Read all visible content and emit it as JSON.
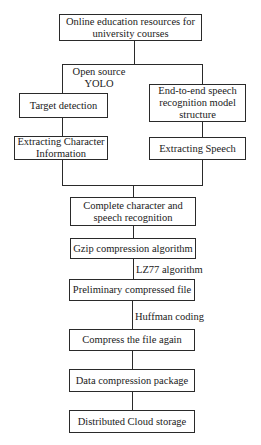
{
  "diagram": {
    "type": "flowchart",
    "nodes": {
      "source": "Online education resources for university courses",
      "target_detection": "Target detection",
      "speech_model": "End-to-end speech recognition model structure",
      "extract_char": "Extracting Character Information",
      "extract_speech": "Extracting Speech",
      "complete": "Complete character and speech recognition",
      "gzip": "Gzip compression algorithm",
      "preliminary": "Preliminary compressed file",
      "compress_again": "Compress the file again",
      "package": "Data compression package",
      "cloud": "Distributed Cloud storage"
    },
    "edge_labels": {
      "yolo": "Open source YOLO",
      "lz77": "LZ77 algorithm",
      "huffman": "Huffman coding"
    },
    "edges": [
      {
        "from": "source",
        "to": "target_detection",
        "label": "Open source YOLO"
      },
      {
        "from": "source",
        "to": "speech_model"
      },
      {
        "from": "target_detection",
        "to": "extract_char"
      },
      {
        "from": "speech_model",
        "to": "extract_speech"
      },
      {
        "from": "extract_char",
        "to": "complete"
      },
      {
        "from": "extract_speech",
        "to": "complete"
      },
      {
        "from": "complete",
        "to": "gzip"
      },
      {
        "from": "gzip",
        "to": "preliminary",
        "label": "LZ77 algorithm"
      },
      {
        "from": "preliminary",
        "to": "compress_again",
        "label": "Huffman coding"
      },
      {
        "from": "compress_again",
        "to": "package"
      },
      {
        "from": "package",
        "to": "cloud"
      }
    ],
    "colors": {
      "line": "#2a2a2a",
      "background": "#ffffff",
      "text": "#1a1a1a"
    }
  }
}
